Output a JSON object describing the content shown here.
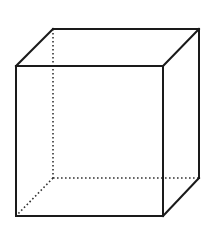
{
  "diagram": {
    "type": "wireframe-cube",
    "projection": "oblique",
    "colors": {
      "background": "#ffffff",
      "edge": "#1a1a1a",
      "hidden_edge": "#333333"
    },
    "vertices": {
      "front_top_left": [
        16,
        66
      ],
      "front_top_right": [
        163,
        66
      ],
      "front_bottom_left": [
        16,
        216
      ],
      "front_bottom_right": [
        163,
        216
      ],
      "back_top_left": [
        53,
        29
      ],
      "back_top_right": [
        199,
        29
      ],
      "back_bottom_left": [
        53,
        178
      ],
      "back_bottom_right": [
        199,
        178
      ]
    },
    "visible_edges": [
      [
        "front_top_left",
        "front_top_right"
      ],
      [
        "front_top_right",
        "front_bottom_right"
      ],
      [
        "front_bottom_right",
        "front_bottom_left"
      ],
      [
        "front_bottom_left",
        "front_top_left"
      ],
      [
        "front_top_left",
        "back_top_left"
      ],
      [
        "back_top_left",
        "back_top_right"
      ],
      [
        "back_top_right",
        "front_top_right"
      ],
      [
        "back_top_right",
        "back_bottom_right"
      ],
      [
        "back_bottom_right",
        "front_bottom_right"
      ]
    ],
    "hidden_edges": [
      [
        "back_top_left",
        "back_bottom_left"
      ],
      [
        "back_bottom_left",
        "back_bottom_right"
      ],
      [
        "back_bottom_left",
        "front_bottom_left"
      ]
    ]
  }
}
